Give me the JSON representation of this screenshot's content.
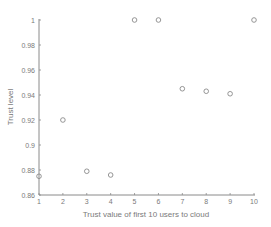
{
  "chart_data": {
    "type": "scatter",
    "title": "",
    "xlabel": "Trust value of first 10 users to cloud",
    "ylabel": "Trust level",
    "x": [
      1,
      2,
      3,
      4,
      5,
      6,
      7,
      8,
      9,
      10
    ],
    "y": [
      0.875,
      0.92,
      0.879,
      0.876,
      1.0,
      1.0,
      0.945,
      0.943,
      0.941,
      1.0
    ],
    "xlim": [
      1,
      10
    ],
    "ylim": [
      0.86,
      1.0
    ],
    "xticks": [
      1,
      2,
      3,
      4,
      5,
      6,
      7,
      8,
      9,
      10
    ],
    "xtick_labels": [
      "1",
      "2",
      "3",
      "4",
      "5",
      "6",
      "7",
      "8",
      "9",
      "10"
    ],
    "yticks": [
      0.86,
      0.88,
      0.9,
      0.92,
      0.94,
      0.96,
      0.98,
      1.0
    ],
    "ytick_labels": [
      "0.86",
      "0.88",
      "0.9",
      "0.92",
      "0.94",
      "0.96",
      "0.98",
      "1"
    ],
    "marker": "circle-open",
    "grid": false,
    "legend": null,
    "colors": {
      "axis": "#8a8a8a",
      "marker": "#8a8a8a",
      "text": "#7a7a7a"
    }
  }
}
